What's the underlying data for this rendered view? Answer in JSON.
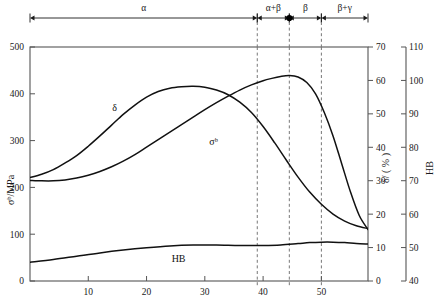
{
  "chart_data": {
    "type": "line",
    "title": "",
    "xlabel": "",
    "xlim": [
      0,
      58
    ],
    "x_ticks": [
      10,
      20,
      30,
      40,
      50
    ],
    "axes": [
      {
        "id": "sigma",
        "label": "σᵇ/MPa",
        "side": "left",
        "lim": [
          0,
          500
        ],
        "ticks": [
          0,
          100,
          200,
          300,
          400,
          500
        ]
      },
      {
        "id": "delta",
        "label": "δ/ ( % )",
        "side": "right",
        "lim": [
          0,
          70
        ],
        "ticks": [
          0,
          10,
          20,
          30,
          40,
          50,
          60,
          70
        ]
      },
      {
        "id": "hb",
        "label": "HB",
        "side": "right-outer",
        "lim": [
          40,
          110
        ],
        "ticks": [
          40,
          50,
          60,
          70,
          80,
          90,
          100,
          110
        ]
      }
    ],
    "series": [
      {
        "name": "σᵇ",
        "axis": "sigma",
        "label": "σᵇ",
        "label_x": 31.5,
        "label_y": 290,
        "points": [
          [
            0,
            215
          ],
          [
            2,
            214
          ],
          [
            4,
            214
          ],
          [
            6,
            216
          ],
          [
            8,
            220
          ],
          [
            10,
            226
          ],
          [
            12,
            234
          ],
          [
            14,
            244
          ],
          [
            16,
            256
          ],
          [
            18,
            270
          ],
          [
            20,
            286
          ],
          [
            22,
            302
          ],
          [
            24,
            318
          ],
          [
            26,
            334
          ],
          [
            28,
            350
          ],
          [
            30,
            366
          ],
          [
            32,
            381
          ],
          [
            34,
            395
          ],
          [
            36,
            408
          ],
          [
            38,
            419
          ],
          [
            40,
            428
          ],
          [
            41.5,
            433
          ],
          [
            43,
            437
          ],
          [
            44.5,
            439
          ],
          [
            46,
            436
          ],
          [
            47.5,
            424
          ],
          [
            49,
            400
          ],
          [
            50.5,
            360
          ],
          [
            52,
            310
          ],
          [
            53.5,
            250
          ],
          [
            55,
            190
          ],
          [
            56.5,
            140
          ],
          [
            58,
            110
          ]
        ]
      },
      {
        "name": "δ",
        "axis": "sigma",
        "label": "δ",
        "label_x": 14.5,
        "label_y": 363,
        "points": [
          [
            0,
            221
          ],
          [
            2,
            228
          ],
          [
            4,
            238
          ],
          [
            6,
            252
          ],
          [
            8,
            268
          ],
          [
            10,
            288
          ],
          [
            12,
            310
          ],
          [
            14,
            333
          ],
          [
            16,
            356
          ],
          [
            18,
            376
          ],
          [
            20,
            393
          ],
          [
            22,
            405
          ],
          [
            24,
            412
          ],
          [
            26,
            415
          ],
          [
            28,
            416
          ],
          [
            30,
            414
          ],
          [
            32,
            408
          ],
          [
            34,
            398
          ],
          [
            36,
            382
          ],
          [
            38,
            360
          ],
          [
            40,
            330
          ],
          [
            42,
            295
          ],
          [
            44,
            258
          ],
          [
            46,
            222
          ],
          [
            48,
            190
          ],
          [
            50,
            164
          ],
          [
            52,
            143
          ],
          [
            54,
            128
          ],
          [
            56,
            118
          ],
          [
            58,
            112
          ]
        ]
      },
      {
        "name": "HB",
        "axis": "sigma",
        "label": "HB",
        "label_x": 25.5,
        "label_y": 40,
        "points": [
          [
            0,
            40
          ],
          [
            4,
            46
          ],
          [
            8,
            53
          ],
          [
            12,
            60
          ],
          [
            16,
            66
          ],
          [
            20,
            71
          ],
          [
            24,
            75
          ],
          [
            28,
            77
          ],
          [
            32,
            77
          ],
          [
            36,
            76
          ],
          [
            40,
            76
          ],
          [
            43,
            77
          ],
          [
            46,
            80
          ],
          [
            48,
            82
          ],
          [
            50,
            83
          ],
          [
            52,
            83
          ],
          [
            54,
            82
          ],
          [
            56,
            80
          ],
          [
            58,
            79
          ]
        ]
      }
    ],
    "phase_regions": [
      {
        "label": "α",
        "from": 0,
        "to": 39
      },
      {
        "label": "α+β",
        "from": 39,
        "to": 44.5
      },
      {
        "label": "β",
        "from": 44.5,
        "to": 50
      },
      {
        "label": "β+γ",
        "from": 50,
        "to": 58
      }
    ],
    "phase_boundaries": [
      39,
      44.5,
      50
    ],
    "phase_marker_x": 44.5,
    "grid": false,
    "legend": "inline-curve-labels"
  },
  "labels": {
    "sigma_axis": "σᵇ/MPa",
    "delta_axis": "δ/ ( % )",
    "hb_axis": "HB",
    "curve_sigma": "σᵇ",
    "curve_delta": "δ",
    "curve_hb": "HB",
    "phase_alpha": "α",
    "phase_alpha_beta": "α+β",
    "phase_beta": "β",
    "phase_beta_gamma": "β+γ"
  },
  "x_tick_labels": [
    "10",
    "20",
    "30",
    "40",
    "50"
  ],
  "sigma_tick_labels": [
    "0",
    "100",
    "200",
    "300",
    "400",
    "500"
  ],
  "delta_tick_labels": [
    "0",
    "10",
    "20",
    "30",
    "40",
    "50",
    "60",
    "70"
  ],
  "hb_tick_labels": [
    "40",
    "50",
    "60",
    "70",
    "80",
    "90",
    "100",
    "110"
  ],
  "colors": {
    "curve": "#111111",
    "axis": "#555555",
    "dashed": "#777777",
    "text": "#1a1a1a",
    "background": "#ffffff"
  }
}
